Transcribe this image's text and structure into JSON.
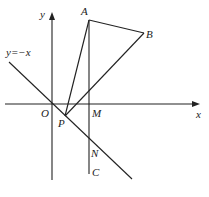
{
  "diagram": {
    "type": "coordinate-geometry",
    "axes": {
      "x_label": "x",
      "y_label": "y",
      "origin_label": "O"
    },
    "line_label": "y=−x",
    "points": {
      "A": "A",
      "B": "B",
      "M": "M",
      "P": "P",
      "N": "N",
      "C": "C"
    },
    "segments": [
      "AB",
      "BP",
      "AP",
      "AC"
    ],
    "colors": {
      "stroke": "#222222",
      "background": "#ffffff"
    }
  }
}
